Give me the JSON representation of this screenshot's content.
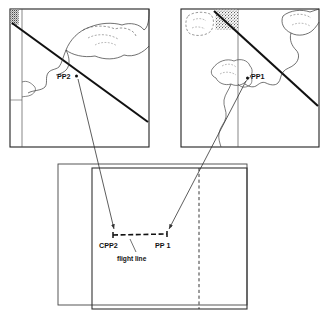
{
  "figure": {
    "type": "photogrammetry-stereo-pair-diagram",
    "background": "#ffffff",
    "ink": "#111111",
    "line_color": "#333333",
    "width": 328,
    "height": 316
  },
  "panels": {
    "left_photo": {
      "name": "left-aerial-photo",
      "frame": {
        "x": 10,
        "y": 9,
        "w": 139,
        "h": 138
      },
      "point_label": "PP2",
      "point": {
        "x": 76,
        "y": 76
      },
      "label_pos": {
        "x": 57,
        "y": 77
      },
      "flight_strip_line": {
        "x1": 14,
        "y1": 25,
        "x2": 147,
        "y2": 122
      },
      "inner_vertical_x": 22,
      "corner_patch": {
        "x": 10,
        "y": 9,
        "w": 8,
        "h": 14
      }
    },
    "right_photo": {
      "name": "right-aerial-photo",
      "frame": {
        "x": 181,
        "y": 9,
        "w": 138,
        "h": 138
      },
      "point_label": "PP1",
      "point": {
        "x": 248,
        "y": 78
      },
      "label_pos": {
        "x": 252,
        "y": 77
      },
      "flight_strip_line": {
        "x1": 215,
        "y1": 11,
        "x2": 318,
        "y2": 105
      },
      "inner_vertical_x": 238,
      "corner_patch": {
        "x": 215,
        "y": 10,
        "w": 24,
        "h": 20
      }
    },
    "map": {
      "name": "index-map-panel",
      "frame": {
        "x": 58,
        "y": 163,
        "w": 189,
        "h": 142
      },
      "inner_frame": {
        "x": 92,
        "y": 167,
        "w": 155,
        "h": 142
      },
      "dashed_vertical_x": 199,
      "flight_line": {
        "x1": 113,
        "y1": 235,
        "x2": 167,
        "y2": 234
      },
      "labels": {
        "left_point": "CPP2",
        "right_point": "PP 1",
        "flight_line": "flight line"
      },
      "left_point_pos": {
        "x": 113,
        "y": 235
      },
      "right_point_pos": {
        "x": 167,
        "y": 234
      },
      "left_label_pos": {
        "x": 101,
        "y": 247
      },
      "right_label_pos": {
        "x": 157,
        "y": 247
      },
      "flight_label_pos": {
        "x": 133,
        "y": 258
      }
    }
  },
  "connectors": [
    {
      "name": "connector-pp2-to-cpp2",
      "x1": 78,
      "y1": 78,
      "x2": 115,
      "y2": 231
    },
    {
      "name": "connector-pp1-to-pp1map",
      "x1": 246,
      "y1": 80,
      "x2": 169,
      "y2": 231
    }
  ]
}
